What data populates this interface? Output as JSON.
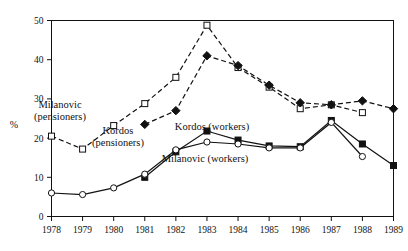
{
  "chart_data": {
    "type": "line",
    "title": "",
    "xlabel": "",
    "ylabel": "%",
    "x": [
      1978,
      1979,
      1980,
      1981,
      1982,
      1983,
      1984,
      1985,
      1986,
      1987,
      1988,
      1989
    ],
    "xtick_labels": [
      "1978",
      "1979",
      "1980",
      "1981",
      "1982",
      "1983",
      "1984",
      "1985",
      "1986",
      "1987",
      "1988",
      "1989"
    ],
    "ytick_labels": [
      "0",
      "10",
      "20",
      "30",
      "40",
      "50"
    ],
    "yticks": [
      0,
      10,
      20,
      30,
      40,
      50
    ],
    "ylim": [
      0,
      50
    ],
    "xlim": [
      1978,
      1989
    ],
    "grid": false,
    "legend_position": "inline-annotations",
    "series": [
      {
        "name": "Milanovic (pensioners)",
        "marker": "open-square",
        "line_style": "dashed",
        "color": "#111111",
        "x": [
          1978,
          1979,
          1980,
          1981,
          1982,
          1983,
          1984,
          1985,
          1986,
          1987,
          1988
        ],
        "values": [
          20.5,
          17.2,
          23.2,
          28.8,
          35.5,
          48.8,
          38.0,
          33.0,
          27.5,
          28.5,
          26.5
        ]
      },
      {
        "name": "Kordos (pensioners)",
        "marker": "filled-diamond",
        "line_style": "dashed",
        "color": "#111111",
        "x": [
          1981,
          1982,
          1983,
          1984,
          1985,
          1986,
          1987,
          1988,
          1989
        ],
        "values": [
          23.5,
          27.0,
          41.0,
          38.5,
          33.5,
          29.0,
          28.5,
          29.5,
          27.5
        ]
      },
      {
        "name": "Kordos (workers)",
        "marker": "filled-square",
        "line_style": "solid",
        "color": "#111111",
        "x": [
          1981,
          1982,
          1983,
          1984,
          1985,
          1986,
          1987,
          1988,
          1989
        ],
        "values": [
          10.0,
          16.5,
          21.8,
          19.5,
          18.0,
          17.8,
          24.5,
          18.5,
          13.0
        ]
      },
      {
        "name": "Milanovic (workers)",
        "marker": "open-circle",
        "line_style": "solid",
        "color": "#111111",
        "x": [
          1978,
          1979,
          1980,
          1981,
          1982,
          1983,
          1984,
          1985,
          1986,
          1987,
          1988
        ],
        "values": [
          6.0,
          5.6,
          7.3,
          10.8,
          17.0,
          19.0,
          18.5,
          17.5,
          17.5,
          24.0,
          15.3
        ]
      }
    ],
    "annotations": [
      {
        "id": "milanovic-pensioners",
        "line1": "Milanovic",
        "line2": "(pensioners)",
        "x": 60,
        "y": 108
      },
      {
        "id": "kordos-pensioners",
        "line1": "Kordos",
        "line2": "(pensioners)",
        "x": 118,
        "y": 134
      },
      {
        "id": "kordos-workers",
        "line1": "Kordos (workers)",
        "line2": "",
        "x": 212,
        "y": 130
      },
      {
        "id": "milanovic-workers",
        "line1": "Milanovic (workers)",
        "line2": "",
        "x": 205,
        "y": 162
      }
    ]
  },
  "axis": {
    "y_axis_title": "%"
  }
}
